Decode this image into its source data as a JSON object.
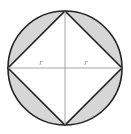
{
  "figure": {
    "background_color": "#ffffff",
    "circle": {
      "center_x": 65,
      "center_y": 68,
      "radius": 57,
      "stroke_color": "#222222",
      "stroke_width": 1.6,
      "fill_color": "#d6d6d6"
    },
    "square": {
      "name": "inscribed-square",
      "rotation_degrees": 45,
      "stroke_color": "#222222",
      "stroke_width": 1.6,
      "fill_color": "#ffffff",
      "vertices": [
        {
          "name": "top",
          "x": 65,
          "y": 11
        },
        {
          "name": "right",
          "x": 122,
          "y": 68
        },
        {
          "name": "bottom",
          "x": 65,
          "y": 125
        },
        {
          "name": "left",
          "x": 8,
          "y": 68
        }
      ]
    },
    "segments": {
      "name": "shaded-circular-segments",
      "count": 4,
      "fill_color": "#d6d6d6"
    },
    "radii": [
      {
        "name": "radius-left",
        "label": "r",
        "from_x": 65,
        "from_y": 68,
        "to_x": 8,
        "to_y": 68,
        "label_x": 41,
        "label_y": 65,
        "stroke_color": "#9a9a9a",
        "stroke_width": 0.9
      },
      {
        "name": "radius-right",
        "label": "r",
        "from_x": 65,
        "from_y": 68,
        "to_x": 122,
        "to_y": 68,
        "label_x": 86,
        "label_y": 65,
        "stroke_color": "#9a9a9a",
        "stroke_width": 0.9
      }
    ],
    "vertical_axis": {
      "name": "vertical-diagonal",
      "from_x": 65,
      "from_y": 11,
      "to_x": 65,
      "to_y": 125,
      "stroke_color": "#9a9a9a",
      "stroke_width": 0.9
    }
  }
}
